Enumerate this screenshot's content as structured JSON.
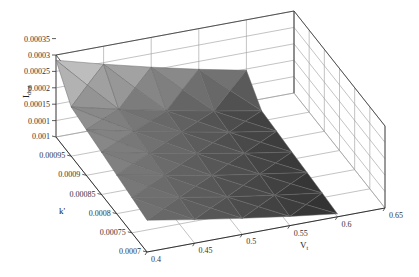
{
  "chart_data": {
    "type": "surface3d",
    "title": "",
    "xlabel": "V_t",
    "ylabel": "k'",
    "zlabel": "I_dsat",
    "x_ticks": [
      "0.4",
      "0.45",
      "0.5",
      "0.55",
      "0.6",
      "0.65"
    ],
    "y_ticks": [
      "0.0007",
      "0.00075",
      "0.0008",
      "0.00085",
      "0.0009",
      "0.00095",
      "0.001"
    ],
    "z_ticks": [
      "0.0001",
      "0.00015",
      "0.0002",
      "0.00025",
      "0.0003",
      "0.00035"
    ],
    "xlim": [
      0.4,
      0.65
    ],
    "ylim": [
      0.0007,
      0.001
    ],
    "zlim": [
      5e-05,
      0.00035
    ],
    "grid": true,
    "colormap": "gray",
    "x": [
      0.4,
      0.45,
      0.5,
      0.55,
      0.6
    ],
    "y": [
      0.0007,
      0.00075,
      0.0008,
      0.00085,
      0.0009,
      0.00095,
      0.001
    ],
    "z": [
      [
        0.000147,
        0.000122,
        9.9e-05,
        7.8e-05,
        5.9e-05
      ],
      [
        0.000158,
        0.000131,
        0.000106,
        8.4e-05,
        6.4e-05
      ],
      [
        0.000168,
        0.00014,
        0.000113,
        9e-05,
        6.8e-05
      ],
      [
        0.000179,
        0.000149,
        0.000121,
        9.5e-05,
        7.2e-05
      ],
      [
        0.000189,
        0.000157,
        0.000128,
        0.000101,
        7.7e-05
      ],
      [
        0.0002,
        0.000166,
        0.000135,
        0.000107,
        8.1e-05
      ],
      [
        0.000284,
        0.000245,
        0.000209,
        0.000176,
        0.000146
      ]
    ]
  },
  "labels": {
    "xlabel_main": "V",
    "xlabel_sub": "t",
    "ylabel": "k'",
    "zlabel_main": "I",
    "zlabel_sub": "dsat"
  }
}
